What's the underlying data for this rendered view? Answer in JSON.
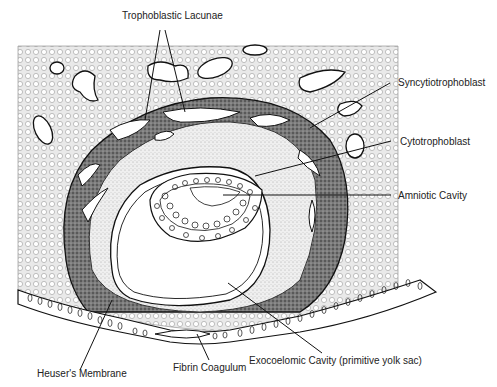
{
  "diagram": {
    "type": "anatomical-illustration",
    "labels": {
      "trophoblastic_lacunae": "Trophoblastic Lacunae",
      "syncytiotrophoblast": "Syncytiotrophoblast",
      "cytotrophoblast": "Cytotrophoblast",
      "amniotic_cavity": "Amniotic Cavity",
      "heusers_membrane": "Heuser's Membrane",
      "fibrin_coagulum": "Fibrin Coagulum",
      "exocoelomic_cavity": "Exocoelomic Cavity (primitive yolk sac)"
    },
    "colors": {
      "line": "#111111",
      "stroma_bg": "#e6e6e6",
      "syncytio": "#6a6a6a",
      "cyto": "#d4d4d4",
      "cavity": "#ffffff"
    }
  }
}
